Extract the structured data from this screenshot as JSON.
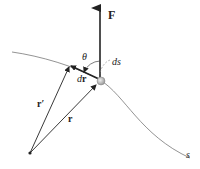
{
  "diagram": {
    "labels": {
      "force": "F",
      "theta": "θ",
      "ds": "ds",
      "dr_d": "d",
      "dr_r": "r",
      "r_prime": "r′",
      "r": "r",
      "path": "s"
    },
    "colors": {
      "curve": "#777777",
      "vector": "#222222",
      "particle": "#bbbbbb"
    }
  }
}
